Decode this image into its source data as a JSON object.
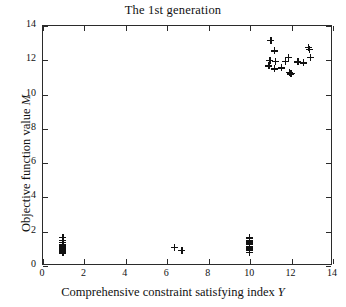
{
  "chart_data": {
    "type": "scatter",
    "title": "The 1st generation",
    "xlabel_text": "Comprehensive constraint satisfying index ",
    "xlabel_var": "Y",
    "ylabel_text": "Objective function value ",
    "ylabel_var": "M",
    "xlim": [
      0,
      14
    ],
    "ylim": [
      0,
      14
    ],
    "xticks": [
      0,
      2,
      4,
      6,
      8,
      10,
      12,
      14
    ],
    "yticks": [
      0,
      2,
      4,
      6,
      8,
      10,
      12,
      14
    ],
    "xtick_labels": [
      "0",
      "2",
      "4",
      "6",
      "8",
      "10",
      "12",
      "14"
    ],
    "ytick_labels": [
      "0",
      "2",
      "4",
      "6",
      "8",
      "10",
      "12",
      "14"
    ],
    "grid": false,
    "legend": null,
    "marker": "+",
    "marker_color": "#111111",
    "series": [
      {
        "name": "Population individuals",
        "points": [
          [
            1.0,
            1.62
          ],
          [
            1.0,
            1.45
          ],
          [
            1.0,
            1.32
          ],
          [
            1.0,
            1.2
          ],
          [
            1.0,
            1.12
          ],
          [
            1.0,
            1.05
          ],
          [
            1.0,
            0.98
          ],
          [
            1.0,
            0.9
          ],
          [
            1.0,
            0.82
          ],
          [
            1.0,
            0.72
          ],
          [
            6.4,
            1.02
          ],
          [
            6.75,
            0.85
          ],
          [
            10.0,
            1.58
          ],
          [
            10.0,
            1.42
          ],
          [
            10.0,
            1.3
          ],
          [
            10.0,
            1.2
          ],
          [
            10.0,
            1.1
          ],
          [
            10.0,
            1.0
          ],
          [
            10.0,
            0.92
          ],
          [
            10.0,
            0.84
          ],
          [
            10.0,
            0.75
          ],
          [
            11.05,
            13.1
          ],
          [
            11.2,
            12.5
          ],
          [
            11.0,
            11.95
          ],
          [
            11.25,
            11.9
          ],
          [
            10.95,
            11.62
          ],
          [
            11.2,
            11.45
          ],
          [
            11.75,
            11.9
          ],
          [
            11.55,
            11.5
          ],
          [
            11.9,
            12.1
          ],
          [
            11.95,
            11.25
          ],
          [
            12.0,
            11.15
          ],
          [
            12.05,
            11.2
          ],
          [
            12.35,
            11.85
          ],
          [
            12.6,
            11.8
          ],
          [
            12.85,
            12.7
          ],
          [
            12.9,
            12.6
          ],
          [
            12.95,
            12.1
          ]
        ]
      }
    ]
  }
}
